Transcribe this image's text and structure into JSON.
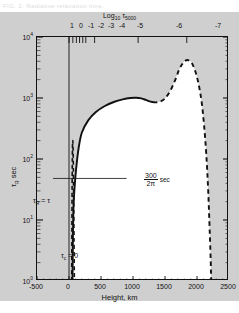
{
  "caption": "FIG. 2. Radiative relaxation time.",
  "figure": {
    "background_color": "#cfcfcf",
    "plot_fill_color": "#ffffff",
    "frame_color": "#111111"
  },
  "chart_data": {
    "type": "line",
    "title": "",
    "xlabel": "Height,  km",
    "ylabel": "τR  sec",
    "top_axis_label": "Log10 τ5000",
    "xlim": [
      -500,
      2500
    ],
    "ylim": [
      1,
      10000
    ],
    "yscale": "log",
    "grid": false,
    "legend": "none",
    "x_ticks": [
      -500,
      0,
      500,
      1000,
      1500,
      2000,
      2500
    ],
    "x_tick_labels": [
      "-500",
      "0",
      "500",
      "1000",
      "1500",
      "2000",
      "2500"
    ],
    "y_ticks": [
      1,
      10,
      100,
      1000,
      10000
    ],
    "y_tick_labels": [
      "10⁰",
      "10¹",
      "10²",
      "10³",
      "10⁴"
    ],
    "top_ticks": [
      {
        "label": "1",
        "x": 0
      },
      {
        "label": "0",
        "x": 60
      },
      {
        "label": "-1",
        "x": 115
      },
      {
        "label": "-2",
        "x": 165
      },
      {
        "label": "-3",
        "x": 215
      },
      {
        "label": "-4",
        "x": 262
      },
      {
        "label": "-5",
        "x": 400
      },
      {
        "label": "-6",
        "x": 1080
      },
      {
        "label": "-7",
        "x": 1840
      }
    ],
    "series": [
      {
        "name": "tau_R solid branch",
        "style": "solid",
        "points": [
          [
            55,
            1.0
          ],
          [
            58,
            2.0
          ],
          [
            62,
            6.0
          ],
          [
            68,
            14
          ],
          [
            78,
            24
          ],
          [
            92,
            40
          ],
          [
            115,
            75
          ],
          [
            150,
            150
          ],
          [
            200,
            270
          ],
          [
            300,
            430
          ],
          [
            420,
            590
          ],
          [
            560,
            740
          ],
          [
            700,
            860
          ],
          [
            840,
            950
          ],
          [
            960,
            1000
          ],
          [
            1050,
            1010
          ],
          [
            1130,
            985
          ],
          [
            1200,
            930
          ],
          [
            1260,
            880
          ],
          [
            1310,
            855
          ]
        ]
      },
      {
        "name": "tau_R dashed continuation",
        "style": "dashed",
        "points": [
          [
            1310,
            855
          ],
          [
            1370,
            850
          ],
          [
            1430,
            880
          ],
          [
            1490,
            960
          ],
          [
            1550,
            1150
          ],
          [
            1610,
            1500
          ],
          [
            1670,
            2100
          ],
          [
            1720,
            2900
          ],
          [
            1770,
            3600
          ],
          [
            1820,
            4100
          ],
          [
            1870,
            4150
          ],
          [
            1915,
            3800
          ],
          [
            1955,
            3100
          ],
          [
            1995,
            2300
          ],
          [
            2035,
            1500
          ],
          [
            2075,
            820
          ],
          [
            2110,
            360
          ],
          [
            2145,
            120
          ],
          [
            2175,
            30
          ],
          [
            2200,
            6.0
          ],
          [
            2215,
            2.0
          ],
          [
            2222,
            1.0
          ]
        ]
      },
      {
        "name": "tau_c = 0 dashed near-zero branch",
        "style": "dashed",
        "points": [
          [
            42,
            1.0
          ],
          [
            44,
            3.0
          ],
          [
            46,
            9.0
          ],
          [
            48,
            25
          ],
          [
            50,
            55
          ],
          [
            52,
            100
          ],
          [
            54,
            150
          ],
          [
            56,
            185
          ],
          [
            58,
            200
          ],
          [
            60,
            195
          ],
          [
            63,
            160
          ],
          [
            66,
            100
          ],
          [
            70,
            45
          ],
          [
            74,
            16
          ],
          [
            78,
            5.0
          ],
          [
            82,
            1.6
          ],
          [
            84,
            1.0
          ]
        ]
      }
    ],
    "annotations": [
      {
        "name": "reference-line",
        "text": "300 / 2π sec",
        "numerator": "300",
        "denominator": "2π",
        "unit": "sec",
        "y_value": 48,
        "x_from": -250,
        "x_to": 900
      },
      {
        "name": "tau-r-equals-tau",
        "text": "τR = τ",
        "x": -300,
        "y": 20
      },
      {
        "name": "tau-c-equals-zero",
        "text": "τc = 0",
        "x": 120,
        "y": 2.6
      }
    ]
  }
}
